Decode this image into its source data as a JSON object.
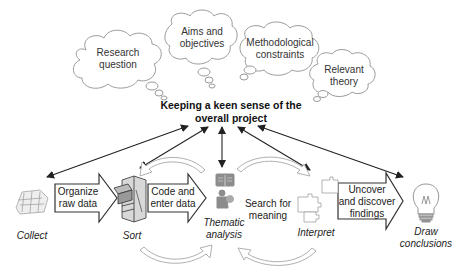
{
  "clouds": [
    {
      "id": "research-question",
      "label_line1": "Research",
      "label_line2": "question"
    },
    {
      "id": "aims-objectives",
      "label_line1": "Aims and",
      "label_line2": "objectives"
    },
    {
      "id": "methodological-constraints",
      "label_line1": "Methodological",
      "label_line2": "constraints"
    },
    {
      "id": "relevant-theory",
      "label_line1": "Relevant",
      "label_line2": "theory"
    }
  ],
  "center": {
    "label_line1": "Keeping a keen sense of the",
    "label_line2": "overall project"
  },
  "stages": [
    {
      "id": "collect",
      "label": "Collect",
      "icon": "paper-pile-icon"
    },
    {
      "id": "sort",
      "label": "Sort",
      "icon": "filing-cabinet-icon"
    },
    {
      "id": "thematic-analysis",
      "label_line1": "Thematic",
      "label_line2": "analysis",
      "icon": "book-person-icon"
    },
    {
      "id": "interpret",
      "label": "Interpret",
      "icon": "puzzle-icon"
    },
    {
      "id": "draw-conclusions",
      "label_line1": "Draw",
      "label_line2": "conclusions",
      "icon": "lightbulb-icon"
    }
  ],
  "process_arrows": [
    {
      "id": "organize",
      "label_line1": "Organize",
      "label_line2": "raw data"
    },
    {
      "id": "code-enter",
      "label_line1": "Code and",
      "label_line2": "enter data"
    },
    {
      "id": "search-meaning",
      "label_line1": "Search for",
      "label_line2": "meaning"
    },
    {
      "id": "uncover",
      "label_line1": "Uncover",
      "label_line2": "and discover",
      "label_line3": "findings"
    }
  ],
  "colors": {
    "line": "#222222",
    "cloud_stroke": "#9a9a9a",
    "cycle_arrow": "#b8b8b8",
    "icon_gray": "#8c8c8c"
  }
}
